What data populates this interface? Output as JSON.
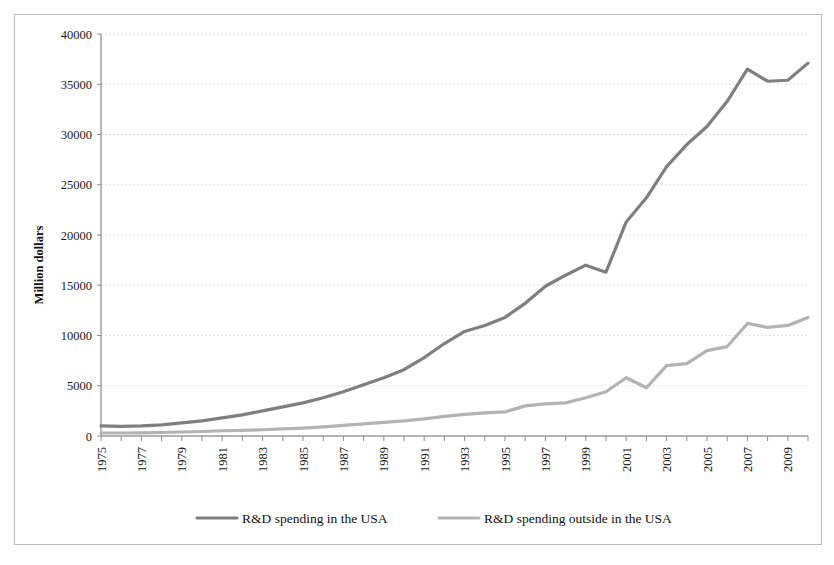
{
  "figure": {
    "border_color": "#b9b9b9",
    "background": "#ffffff"
  },
  "chart_data": {
    "type": "line",
    "title": "",
    "xlabel": "",
    "ylabel": "Million dollars",
    "ylim": [
      0,
      40000
    ],
    "xlim": [
      1975,
      2010
    ],
    "ytick_labels": [
      "0",
      "5000",
      "10000",
      "15000",
      "20000",
      "25000",
      "30000",
      "35000",
      "40000"
    ],
    "ytick_values": [
      0,
      5000,
      10000,
      15000,
      20000,
      25000,
      30000,
      35000,
      40000
    ],
    "xtick_labels": [
      "1975",
      "1977",
      "1979",
      "1981",
      "1983",
      "1985",
      "1987",
      "1989",
      "1991",
      "1993",
      "1995",
      "1997",
      "1999",
      "2001",
      "2003",
      "2005",
      "2007",
      "2009"
    ],
    "xtick_values": [
      1975,
      1977,
      1979,
      1981,
      1983,
      1985,
      1987,
      1989,
      1991,
      1993,
      1995,
      1997,
      1999,
      2001,
      2003,
      2005,
      2007,
      2009
    ],
    "x": [
      1975,
      1976,
      1977,
      1978,
      1979,
      1980,
      1981,
      1982,
      1983,
      1984,
      1985,
      1986,
      1987,
      1988,
      1989,
      1990,
      1991,
      1992,
      1993,
      1994,
      1995,
      1996,
      1997,
      1998,
      1999,
      2000,
      2001,
      2002,
      2003,
      2004,
      2005,
      2006,
      2007,
      2008,
      2009,
      2010
    ],
    "grid": true,
    "legend_position": "bottom",
    "series": [
      {
        "name": "R&D spending in the USA",
        "color": "#7f7f7f",
        "width": 3.2,
        "values": [
          1000,
          950,
          1000,
          1100,
          1300,
          1500,
          1800,
          2100,
          2500,
          2900,
          3300,
          3800,
          4400,
          5100,
          5800,
          6600,
          7800,
          9200,
          10400,
          11000,
          11800,
          13200,
          14900,
          16000,
          17000,
          16300,
          21300,
          23700,
          26800,
          29000,
          30800,
          33300,
          36500,
          35300,
          35400,
          37100
        ]
      },
      {
        "name": "R&D spending outside in the USA",
        "color": "#b3b3b3",
        "width": 3.2,
        "values": [
          300,
          300,
          320,
          350,
          400,
          450,
          520,
          560,
          620,
          700,
          780,
          900,
          1050,
          1200,
          1350,
          1500,
          1700,
          1950,
          2150,
          2300,
          2400,
          3000,
          3200,
          3300,
          3800,
          4400,
          5800,
          4800,
          7000,
          7200,
          8500,
          8900,
          11200,
          10800,
          11000,
          11800
        ]
      }
    ]
  },
  "legend": {
    "items": [
      {
        "label": "R&D spending in the USA",
        "color": "#7f7f7f"
      },
      {
        "label": "R&D spending outside in the USA",
        "color": "#b3b3b3"
      }
    ]
  }
}
